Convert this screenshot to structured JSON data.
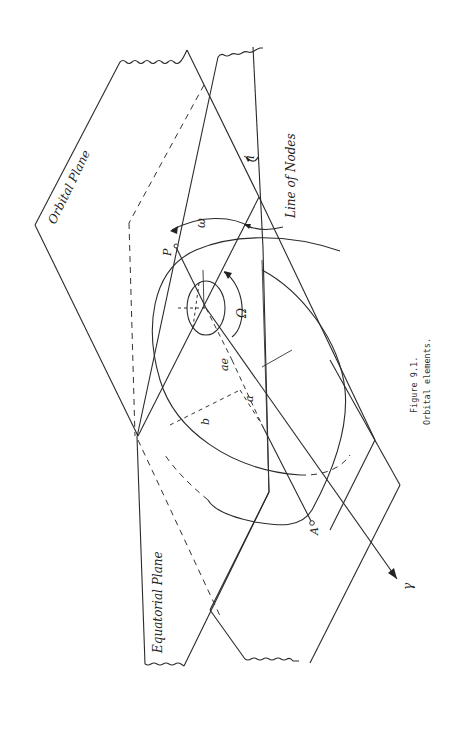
{
  "figure": {
    "caption_number": "Figure 9.1.",
    "caption_title": "Orbital elements."
  },
  "labels": {
    "orbital_plane": "Orbital Plane",
    "equatorial_plane": "Equatorial Plane",
    "line_of_nodes": "Line of Nodes",
    "inclination": "i",
    "argument_of_periapsis": "ω",
    "longitude_of_ascending_node": "Ω",
    "periapsis_point": "P",
    "apoapsis_point": "A",
    "vernal_equinox": "γ",
    "semi_major_axis": "a",
    "semi_minor_axis": "b",
    "focal_distance": "ae"
  }
}
